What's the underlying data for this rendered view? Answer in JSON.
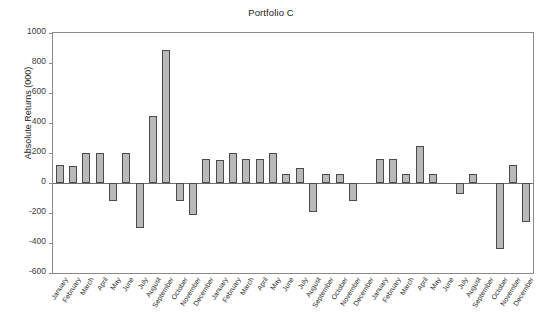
{
  "chart_data": {
    "type": "bar",
    "title": "Portfolio C",
    "xlabel": "",
    "ylabel": "Absolute Returns (000)",
    "ylim": [
      -600,
      1000
    ],
    "ytick_step": 200,
    "ytick_labels": [
      "1000",
      "800",
      "600",
      "400",
      "200",
      "0",
      "-200",
      "-400",
      "-600"
    ],
    "ytick_values": [
      1000,
      800,
      600,
      400,
      200,
      0,
      -200,
      -400,
      -600
    ],
    "grid": false,
    "legend": null,
    "bar_fill_color": "#b9b9b9",
    "bar_edge_color": "#4a4a4a",
    "categories": [
      "January",
      "February",
      "March",
      "April",
      "May",
      "June",
      "July",
      "August",
      "September",
      "October",
      "November",
      "December",
      "January",
      "February",
      "March",
      "April",
      "May",
      "June",
      "July",
      "August",
      "September",
      "October",
      "November",
      "December",
      "January",
      "February",
      "March",
      "April",
      "May",
      "June",
      "July",
      "August",
      "September",
      "October",
      "November",
      "December"
    ],
    "values": [
      120,
      115,
      200,
      200,
      -120,
      200,
      -300,
      450,
      890,
      -120,
      -210,
      160,
      155,
      200,
      160,
      160,
      200,
      60,
      100,
      -190,
      60,
      60,
      -120,
      0,
      160,
      160,
      60,
      250,
      60,
      0,
      -70,
      60,
      0,
      -440,
      120,
      -260
    ],
    "series_name": "Absolute Returns"
  }
}
